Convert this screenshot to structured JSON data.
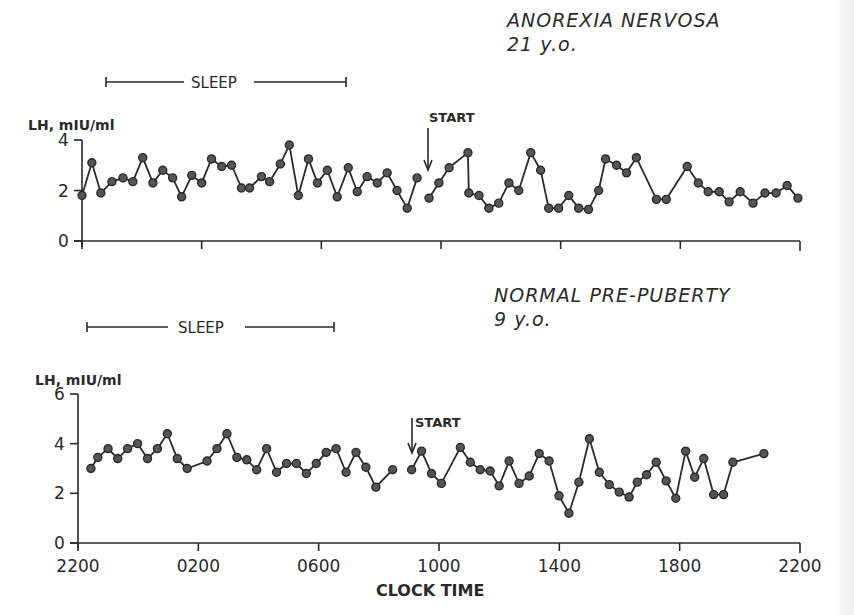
{
  "chart_data": [
    {
      "type": "line",
      "title": "ANOREXIA NERVOSA",
      "subtitle": "21 y.o.",
      "ylabel": "LH, mIU/ml",
      "xlabel": "",
      "ylim": [
        0,
        4
      ],
      "yticks": [
        0,
        2,
        4
      ],
      "xlim_hours_from_2200": [
        0,
        24
      ],
      "xtick_hours": [
        0,
        4,
        8,
        12,
        16,
        20,
        24
      ],
      "grid": false,
      "annotations": {
        "sleep_label": "SLEEP",
        "sleep_start_hours": 0.85,
        "sleep_end_hours": 8.85,
        "start_label": "START",
        "start_hours": 11.5
      },
      "series": [
        {
          "name": "segment-1",
          "hours": [
            0.0,
            0.33,
            0.63,
            1.0,
            1.37,
            1.7,
            2.03,
            2.37,
            2.7,
            3.03,
            3.33,
            3.67,
            4.0,
            4.33,
            4.67,
            5.0,
            5.33,
            5.6,
            6.0,
            6.27,
            6.63,
            6.93,
            7.23,
            7.57,
            7.87,
            8.2,
            8.53,
            8.9,
            9.2,
            9.53,
            9.87,
            10.2,
            10.53,
            10.87,
            11.2
          ],
          "values": [
            1.8,
            3.1,
            1.9,
            2.35,
            2.5,
            2.35,
            3.3,
            2.3,
            2.8,
            2.5,
            1.75,
            2.6,
            2.3,
            3.25,
            2.95,
            3.0,
            2.1,
            2.1,
            2.55,
            2.35,
            3.05,
            3.8,
            1.8,
            3.25,
            2.3,
            2.8,
            1.75,
            2.9,
            1.95,
            2.55,
            2.3,
            2.7,
            2.0,
            1.3,
            2.5
          ]
        },
        {
          "name": "segment-2",
          "hours": [
            11.6,
            11.93,
            12.27,
            12.9,
            12.93,
            13.27,
            13.6,
            13.93,
            14.27,
            14.6,
            15.0,
            15.33,
            15.6,
            15.93,
            16.27,
            16.6,
            16.93,
            17.27,
            17.5,
            17.87,
            18.2,
            18.53,
            19.2,
            19.53,
            20.23,
            20.6,
            20.93,
            21.3,
            21.63,
            22.0,
            22.43,
            22.83,
            23.2,
            23.57,
            23.93
          ],
          "values": [
            1.7,
            2.3,
            2.9,
            3.5,
            1.9,
            1.8,
            1.3,
            1.5,
            2.3,
            2.0,
            3.5,
            2.8,
            1.3,
            1.3,
            1.8,
            1.3,
            1.25,
            2.0,
            3.25,
            3.0,
            2.7,
            3.3,
            1.65,
            1.65,
            2.95,
            2.3,
            1.95,
            1.95,
            1.55,
            1.95,
            1.5,
            1.9,
            1.9,
            2.2,
            1.7
          ]
        }
      ]
    },
    {
      "type": "line",
      "title": "NORMAL PRE-PUBERTY",
      "subtitle": "9 y.o.",
      "ylabel": "LH, mIU/ml",
      "xlabel": "CLOCK TIME",
      "ylim": [
        0,
        6
      ],
      "yticks": [
        0,
        2,
        4,
        6
      ],
      "xlim_hours_from_2200": [
        0,
        24
      ],
      "xtick_hours": [
        0,
        4,
        8,
        12,
        16,
        20,
        24
      ],
      "xtick_labels": [
        "2200",
        "0200",
        "0600",
        "1000",
        "1400",
        "1800",
        "2200"
      ],
      "grid": false,
      "annotations": {
        "sleep_label": "SLEEP",
        "sleep_start_hours": 0.33,
        "sleep_end_hours": 8.6,
        "start_label": "START",
        "start_hours": 11.1
      },
      "series": [
        {
          "name": "segment-1",
          "hours": [
            0.43,
            0.66,
            1.0,
            1.32,
            1.65,
            1.98,
            2.31,
            2.64,
            2.97,
            3.3,
            3.63,
            4.29,
            4.62,
            4.95,
            5.28,
            5.61,
            5.94,
            6.27,
            6.6,
            6.93,
            7.26,
            7.59,
            7.92,
            8.25,
            8.58,
            8.91,
            9.24,
            9.57,
            9.9,
            10.46
          ],
          "values": [
            3.0,
            3.45,
            3.8,
            3.4,
            3.8,
            4.0,
            3.4,
            3.8,
            4.4,
            3.4,
            3.0,
            3.3,
            3.8,
            4.4,
            3.45,
            3.35,
            2.95,
            3.8,
            2.85,
            3.2,
            3.2,
            2.8,
            3.2,
            3.65,
            3.8,
            2.85,
            3.65,
            3.05,
            2.25,
            2.95
          ]
        },
        {
          "name": "segment-2",
          "hours": [
            11.09,
            11.42,
            11.75,
            12.08,
            12.71,
            13.04,
            13.37,
            13.7,
            14.0,
            14.33,
            14.66,
            15.0,
            15.33,
            15.66,
            15.99,
            16.32,
            16.65,
            17.0,
            17.33,
            17.66,
            17.99,
            18.32,
            18.59,
            18.9,
            19.22,
            19.55,
            19.87,
            20.2,
            20.5,
            20.8,
            21.13,
            21.46,
            21.77,
            22.8
          ],
          "values": [
            2.95,
            3.7,
            2.8,
            2.4,
            3.85,
            3.25,
            2.95,
            2.9,
            2.3,
            3.3,
            2.4,
            2.7,
            3.6,
            3.3,
            1.9,
            1.2,
            2.45,
            4.2,
            2.85,
            2.35,
            2.05,
            1.85,
            2.45,
            2.75,
            3.25,
            2.5,
            1.8,
            3.7,
            2.65,
            3.4,
            1.95,
            1.95,
            3.25,
            3.6
          ]
        }
      ]
    }
  ]
}
